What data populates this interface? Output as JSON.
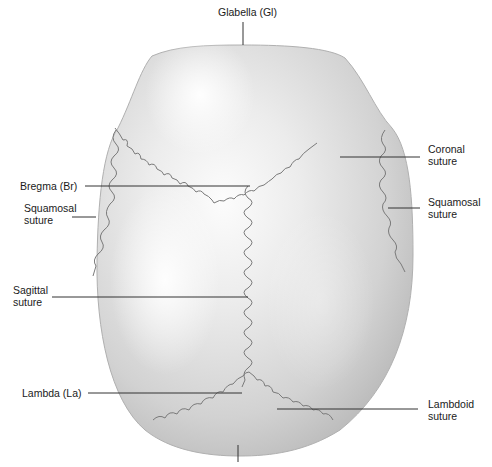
{
  "figure": {
    "labels": {
      "glabella": "Glabella (Gl)",
      "coronal": "Coronal\nsuture",
      "bregma": "Bregma (Br)",
      "squamosal_left": "Squamosal\nsuture",
      "squamosal_right": "Squamosal\nsuture",
      "sagittal": "Sagittal\nsuture",
      "lambda": "Lambda (La)",
      "lambdoid": "Lambdoid\nsuture"
    },
    "colors": {
      "bone": "#d4d4d4",
      "bone_highlight": "#fbfbfb",
      "bone_shadow": "#b5b5b5",
      "suture": "#7a7a7a",
      "leader_line": "#333333",
      "text": "#1a1a1a"
    }
  }
}
